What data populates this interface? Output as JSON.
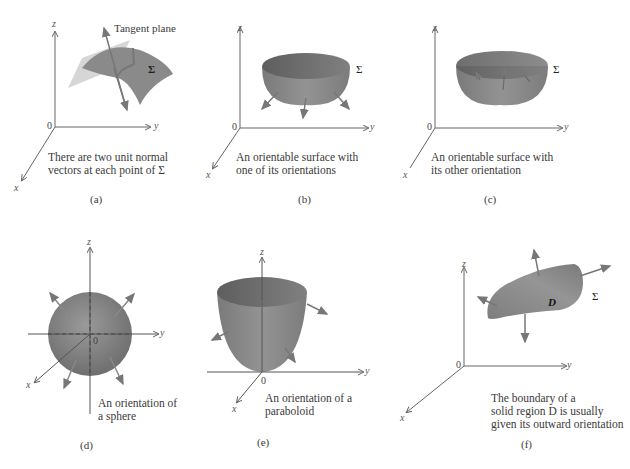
{
  "figure": {
    "panels": [
      {
        "id": "a",
        "label": "(a)",
        "caption": "There are two unit normal\nvectors at each point of Σ",
        "annotation": "Tangent plane",
        "surface_label": "Σ",
        "axes": {
          "x": "x",
          "y": "y",
          "z": "z",
          "origin": "0"
        }
      },
      {
        "id": "b",
        "label": "(b)",
        "caption": "An orientable surface with\none of its orientations",
        "surface_label": "Σ",
        "axes": {
          "x": "x",
          "y": "y",
          "z": "z",
          "origin": "0"
        }
      },
      {
        "id": "c",
        "label": "(c)",
        "caption": "An orientable surface with\nits other orientation",
        "surface_label": "Σ",
        "axes": {
          "x": "x",
          "y": "y",
          "z": "z",
          "origin": "0"
        }
      },
      {
        "id": "d",
        "label": "(d)",
        "caption": "An orientation of\na sphere",
        "axes": {
          "x": "x",
          "y": "y",
          "z": "z",
          "origin": "0"
        }
      },
      {
        "id": "e",
        "label": "(e)",
        "caption": "An orientation of a\nparaboloid",
        "axes": {
          "x": "x",
          "y": "y",
          "z": "z",
          "origin": "0"
        }
      },
      {
        "id": "f",
        "label": "(f)",
        "caption": "The boundary of a\nsolid region D is usually\ngiven its outward orientation",
        "surface_label": "Σ",
        "region_label": "D",
        "axes": {
          "x": "x",
          "y": "y",
          "z": "z",
          "origin": "0"
        }
      }
    ],
    "colors": {
      "surface": "#8a8a8a",
      "surface_dark": "#6e6e6e",
      "plane": "#c8c8c8",
      "arrow": "#7a7a7a",
      "axis": "#666666"
    }
  }
}
